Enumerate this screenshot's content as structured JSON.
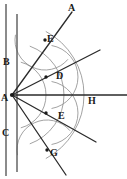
{
  "figure": {
    "width": 127,
    "height": 179,
    "background": "#ffffff",
    "line_color": "#2b2b2b",
    "arc_color": "#8a8a8a",
    "axis_color": "#5a5a5a",
    "label_color": "#1a1a1a"
  },
  "labels": [
    {
      "id": "label-A-top",
      "text": "A",
      "x": 68,
      "y": 3
    },
    {
      "id": "label-B",
      "text": "B",
      "x": 3,
      "y": 57
    },
    {
      "id": "label-E-upper",
      "text": "E",
      "x": 47,
      "y": 34
    },
    {
      "id": "label-D",
      "text": "D",
      "x": 56,
      "y": 71
    },
    {
      "id": "label-A-vertex",
      "text": "A",
      "x": 1,
      "y": 93
    },
    {
      "id": "label-H",
      "text": "H",
      "x": 88,
      "y": 96
    },
    {
      "id": "label-E-lower",
      "text": "E",
      "x": 58,
      "y": 111
    },
    {
      "id": "label-C",
      "text": "C",
      "x": 2,
      "y": 128
    },
    {
      "id": "label-G",
      "text": "G",
      "x": 50,
      "y": 148
    }
  ],
  "vertex": {
    "name": "A",
    "x": 12,
    "y": 95
  },
  "vertical_lines": [
    {
      "id": "outer-vertical",
      "x": 6,
      "y1": 4,
      "y2": 176
    },
    {
      "id": "inner-vertical",
      "x": 17,
      "y1": 14,
      "y2": 172
    }
  ],
  "rays": [
    {
      "id": "ray-A-top",
      "to_x": 72,
      "to_y": 12
    },
    {
      "id": "ray-A-upper-mid",
      "to_x": 100,
      "to_y": 50
    },
    {
      "id": "ray-A-horizontal",
      "to_x": 127,
      "to_y": 95
    },
    {
      "id": "ray-A-lower-mid",
      "to_x": 96,
      "to_y": 142
    },
    {
      "id": "ray-A-bottom",
      "to_x": 66,
      "to_y": 175
    }
  ],
  "arcs": [
    {
      "id": "arc-outer",
      "r": 72,
      "start_deg": -62,
      "end_deg": 62
    },
    {
      "id": "arc-mid",
      "r": 52,
      "start_deg": -70,
      "end_deg": 70
    },
    {
      "id": "arc-inner",
      "r": 34,
      "start_deg": -75,
      "end_deg": 75
    },
    {
      "id": "arc-upper-small",
      "cx": 45,
      "cy": 40,
      "r": 30,
      "start_deg": 40,
      "end_deg": 190
    },
    {
      "id": "arc-lower-small",
      "cx": 47,
      "cy": 150,
      "r": 30,
      "start_deg": 170,
      "end_deg": 320
    },
    {
      "id": "arc-right-upper",
      "cx": 46,
      "cy": 77,
      "r": 32,
      "start_deg": -80,
      "end_deg": 80
    },
    {
      "id": "arc-right-lower",
      "cx": 46,
      "cy": 113,
      "r": 32,
      "start_deg": -80,
      "end_deg": 80
    }
  ],
  "intersection_points": [
    {
      "id": "point-E-upper",
      "x": 45,
      "y": 40
    },
    {
      "id": "point-D",
      "x": 46,
      "y": 77
    },
    {
      "id": "point-E-lower",
      "x": 46,
      "y": 113
    },
    {
      "id": "point-G",
      "x": 47,
      "y": 150
    }
  ]
}
